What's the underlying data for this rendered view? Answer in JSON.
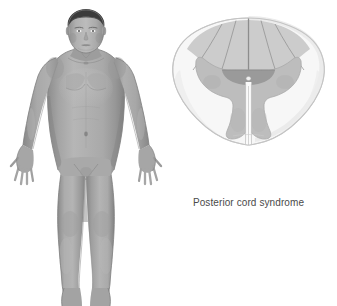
{
  "page": {
    "background_color": "#ffffff",
    "width": 337,
    "height": 306
  },
  "caption": {
    "text": "Posterior cord syndrome",
    "color": "#4a4a4a"
  },
  "body_figure": {
    "name": "anatomical male figure",
    "view": "anterior full body",
    "pose": "standing, arms abducted slightly, fingers spread",
    "colors": {
      "skin_light": "#b5b5b5",
      "skin_mid": "#9e9e9e",
      "skin_shadow": "#858585",
      "skin_deep_shadow": "#6f6f6f",
      "hair": "#3a3a3a",
      "outline": "#7a7a7a"
    },
    "parts": [
      "head",
      "hair",
      "face",
      "neck",
      "shoulders",
      "chest",
      "abdomen",
      "navel",
      "left-arm",
      "right-arm",
      "left-hand",
      "right-hand",
      "pelvis",
      "left-leg",
      "right-leg",
      "left-knee",
      "right-knee",
      "left-foot",
      "right-foot"
    ]
  },
  "spinal_cord": {
    "name": "spinal cord cross section",
    "view": "transverse section",
    "colors": {
      "white_matter": "#f4f4f4",
      "white_matter_edge": "#e6e6e6",
      "outline": "#c9c9c9",
      "gray_matter": "#bdbdbd",
      "gray_matter_edge": "#ababab",
      "affected_posterior": "#c4c4c4",
      "posterior_commissure": "#9a9a9a",
      "fissure_line": "#8c8c8c",
      "central_canal": "#efefef"
    },
    "structures": [
      "posterior median sulcus",
      "posterior columns",
      "posterior horn",
      "lateral white matter",
      "anterior horn",
      "gray commissure",
      "central canal",
      "anterior median fissure"
    ],
    "affected_region": "posterior columns and posterior gray commissure"
  }
}
